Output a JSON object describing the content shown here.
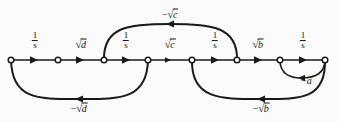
{
  "figure": {
    "type": "signal-flow-graph",
    "background_color": "#fbfbfb",
    "line_color": "#1a1a1a",
    "width": 340,
    "height": 122
  },
  "nodes": [
    {
      "id": "n1",
      "x": 11,
      "y": 60
    },
    {
      "id": "n2",
      "x": 58,
      "y": 60
    },
    {
      "id": "n3",
      "x": 104,
      "y": 60
    },
    {
      "id": "n4",
      "x": 148,
      "y": 60
    },
    {
      "id": "n5",
      "x": 192,
      "y": 60
    },
    {
      "id": "n6",
      "x": 237,
      "y": 60
    },
    {
      "id": "n7",
      "x": 280,
      "y": 60
    },
    {
      "id": "n8",
      "x": 325,
      "y": 60
    }
  ],
  "forward_edges": [
    {
      "id": "e1",
      "from": "n1",
      "to": "n2",
      "label_kind": "fraction",
      "numerator": "1",
      "denominator": "s",
      "label_x": 35,
      "label_y": 41
    },
    {
      "id": "e2",
      "from": "n2",
      "to": "n3",
      "label_kind": "radical",
      "sign": "",
      "radicand": "d",
      "label_x": 81,
      "label_y": 44
    },
    {
      "id": "e3",
      "from": "n3",
      "to": "n4",
      "label_kind": "fraction",
      "numerator": "1",
      "denominator": "s",
      "label_x": 126,
      "label_y": 41
    },
    {
      "id": "e4",
      "from": "n4",
      "to": "n5",
      "label_kind": "radical",
      "sign": "",
      "radicand": "c",
      "label_x": 170,
      "label_y": 44
    },
    {
      "id": "e5",
      "from": "n5",
      "to": "n6",
      "label_kind": "fraction",
      "numerator": "1",
      "denominator": "s",
      "label_x": 215,
      "label_y": 41
    },
    {
      "id": "e6",
      "from": "n6",
      "to": "n7",
      "label_kind": "radical",
      "sign": "",
      "radicand": "b",
      "label_x": 258,
      "label_y": 44
    },
    {
      "id": "e7",
      "from": "n7",
      "to": "n8",
      "label_kind": "fraction",
      "numerator": "1",
      "denominator": "s",
      "label_x": 303,
      "label_y": 41
    }
  ],
  "feedback_edges": [
    {
      "id": "f1",
      "from": "n4",
      "to": "n1",
      "side": "below",
      "label_kind": "radical",
      "sign": "−",
      "radicand": "d",
      "label_x": 79,
      "label_y": 108
    },
    {
      "id": "f2",
      "from": "n6",
      "to": "n3",
      "side": "above",
      "label_kind": "radical",
      "sign": "−",
      "radicand": "c",
      "label_x": 170,
      "label_y": 14
    },
    {
      "id": "f3",
      "from": "n8",
      "to": "n5",
      "side": "below",
      "label_kind": "radical",
      "sign": "−",
      "radicand": "b",
      "label_x": 261,
      "label_y": 108
    },
    {
      "id": "f4",
      "from": "n8",
      "to": "n7",
      "side": "below",
      "label_kind": "plain",
      "text": "−a",
      "label_x": 306,
      "label_y": 81
    }
  ],
  "glyphs": {
    "radical_sign": "√",
    "minus": "−"
  }
}
